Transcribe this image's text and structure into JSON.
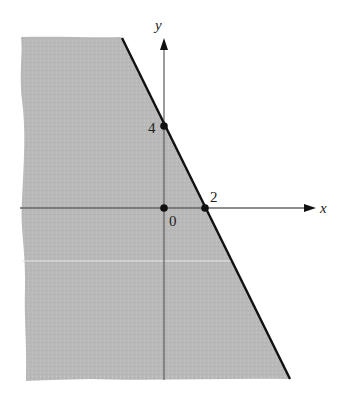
{
  "figure": {
    "type": "inequality-region-graph",
    "inequality": "y <= 4 - 2x",
    "boundary_line": "y = 4 - 2x",
    "shaded_side": "below-left",
    "shade_color": "#b9b9b9",
    "line_color": "#111111",
    "axis_color": "#555555"
  },
  "axes": {
    "x_label": "x",
    "y_label": "y"
  },
  "points": [
    {
      "label": "4",
      "x": 0,
      "y": 4,
      "desc": "y-intercept"
    },
    {
      "label": "0",
      "x": 0,
      "y": 0,
      "desc": "origin"
    },
    {
      "label": "2",
      "x": 2,
      "y": 0,
      "desc": "x-intercept"
    }
  ],
  "labels": {
    "y_intercept": "4",
    "origin": "0",
    "x_intercept": "2"
  }
}
